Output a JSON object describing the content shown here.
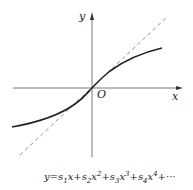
{
  "diagram": {
    "axis_x_label": "x",
    "axis_y_label": "y",
    "origin_label": "O",
    "formula": {
      "lhs": "y=",
      "terms": [
        {
          "coef": "s",
          "sub": "1",
          "var": "x",
          "pow": ""
        },
        {
          "coef": "s",
          "sub": "2",
          "var": "x",
          "pow": "2"
        },
        {
          "coef": "s",
          "sub": "3",
          "var": "x",
          "pow": "3"
        },
        {
          "coef": "s",
          "sub": "4",
          "var": "x",
          "pow": "4"
        }
      ],
      "tail": "+···"
    },
    "curve": "solid S-shaped curve through origin",
    "tangent": "dashed line through origin"
  }
}
